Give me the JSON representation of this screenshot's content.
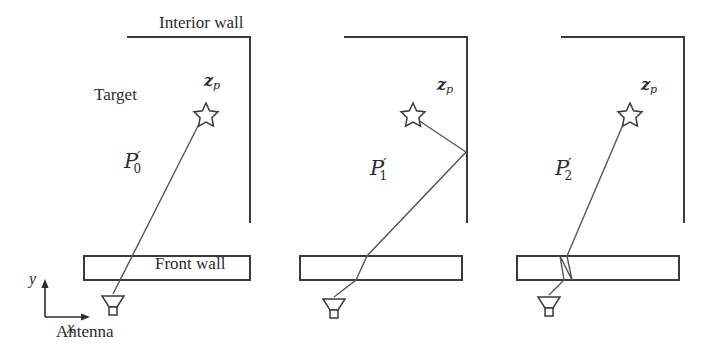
{
  "figure": {
    "type": "diagram",
    "background_color": "#ffffff",
    "line_color": "#3a3a3a",
    "ray_color": "#555555",
    "width": 717,
    "height": 358
  },
  "labels": {
    "interior_wall": "Interior wall",
    "front_wall": "Front wall",
    "target": "Target",
    "antenna": "Antenna",
    "axis_y": "y",
    "axis_x": "x",
    "target_point": "z",
    "target_point_sub": "p"
  },
  "panels": [
    {
      "id": "panel-direct",
      "path_label_base": "P",
      "path_label_prime": "′",
      "path_label_sub": "0",
      "path_label_full": "P′0",
      "has_target_label": true,
      "has_antenna_label": true,
      "has_interior_wall_label": true,
      "has_front_wall_label": true,
      "has_axes": true,
      "ray_kind": "direct",
      "star_x": 206,
      "star_y": 113,
      "antenna_x": 112,
      "antenna_y": 300
    },
    {
      "id": "panel-reflected",
      "path_label_base": "P",
      "path_label_prime": "′",
      "path_label_sub": "1",
      "path_label_full": "P′1",
      "has_target_label": false,
      "has_antenna_label": false,
      "has_interior_wall_label": false,
      "has_front_wall_label": false,
      "has_axes": false,
      "ray_kind": "reflected",
      "star_x": 413,
      "star_y": 113,
      "antenna_x": 333,
      "antenna_y": 303,
      "reflection_x": 467,
      "reflection_y": 152
    },
    {
      "id": "panel-refracted",
      "path_label_base": "P",
      "path_label_prime": "′",
      "path_label_sub": "2",
      "path_label_full": "P′2",
      "has_target_label": false,
      "has_antenna_label": false,
      "has_interior_wall_label": false,
      "has_front_wall_label": false,
      "has_axes": false,
      "ray_kind": "refracted",
      "star_x": 630,
      "star_y": 113,
      "antenna_x": 548,
      "antenna_y": 301
    }
  ]
}
